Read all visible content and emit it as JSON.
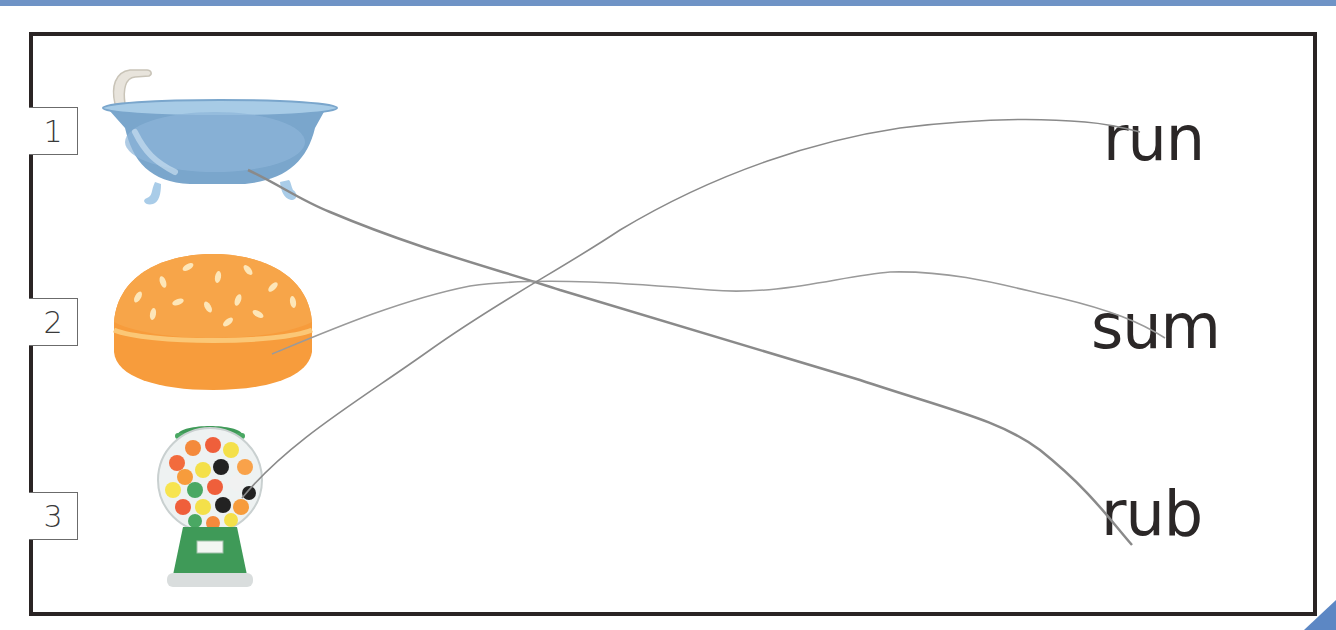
{
  "worksheet": {
    "type": "match-picture-to-word",
    "rows": [
      {
        "number": "1",
        "picture": "bathtub"
      },
      {
        "number": "2",
        "picture": "bun"
      },
      {
        "number": "3",
        "picture": "gumball-machine"
      }
    ],
    "words": [
      "run",
      "sum",
      "rub"
    ],
    "drawn_connections": [
      {
        "from": "1",
        "to": "rub"
      },
      {
        "from": "2",
        "to": "sum"
      },
      {
        "from": "3",
        "to": "run"
      }
    ]
  },
  "colors": {
    "frame": "#2a2424",
    "accent_band": "#6f93c6",
    "line": "#8a8a8a"
  }
}
